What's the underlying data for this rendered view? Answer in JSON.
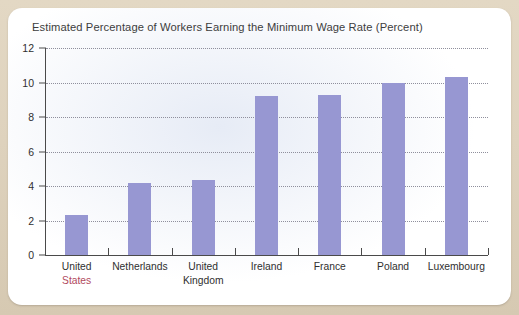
{
  "chart_data": {
    "type": "bar",
    "title": "Estimated Percentage of Workers Earning the Minimum Wage Rate (Percent)",
    "xlabel": "",
    "ylabel": "",
    "ylim": [
      0,
      12
    ],
    "yticks": [
      0,
      2,
      4,
      6,
      8,
      10,
      12
    ],
    "grid": true,
    "legend": "none",
    "bar_color": "#9797d2",
    "categories": [
      "United States",
      "Netherlands",
      "United Kingdom",
      "Ireland",
      "France",
      "Poland",
      "Luxembourg"
    ],
    "category_lines": [
      {
        "line1": "United",
        "line2": "States",
        "line2_highlight": true
      },
      {
        "line1": "Netherlands",
        "line2": "",
        "line2_highlight": false
      },
      {
        "line1": "United",
        "line2": "Kingdom",
        "line2_highlight": false
      },
      {
        "line1": "Ireland",
        "line2": "",
        "line2_highlight": false
      },
      {
        "line1": "France",
        "line2": "",
        "line2_highlight": false
      },
      {
        "line1": "Poland",
        "line2": "",
        "line2_highlight": false
      },
      {
        "line1": "Luxembourg",
        "line2": "",
        "line2_highlight": false
      }
    ],
    "values": [
      2.3,
      4.2,
      4.35,
      9.2,
      9.25,
      10.0,
      10.3
    ],
    "highlight_category": "United States",
    "highlight_color": "#b14a5e"
  },
  "colors": {
    "page_background": "#ded2bd",
    "card_background": "#ffffff",
    "bar": "#9797d2",
    "axis": "#4a4a4a",
    "gridline": "#8f8f9c",
    "text": "#2f2f2f",
    "title_text": "#3d3d3d",
    "highlight": "#b14a5e"
  }
}
